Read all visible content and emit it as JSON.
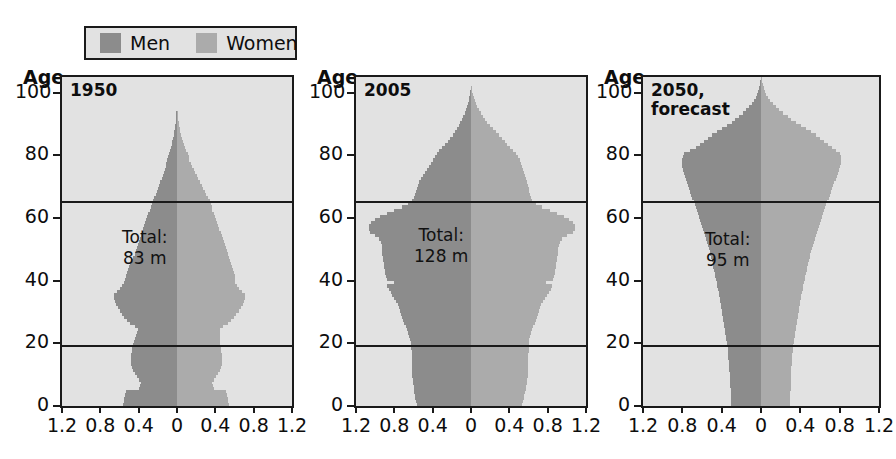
{
  "legend": {
    "men_label": "Men",
    "women_label": "Women",
    "men_color": "#8c8c8c",
    "women_color": "#ababab"
  },
  "axis": {
    "age_title": "Age",
    "y_ticks": [
      "100",
      "80",
      "60",
      "40",
      "20",
      "0"
    ],
    "x_ticks": [
      "1.2",
      "0.8",
      "0.4",
      "0",
      "0.4",
      "0.8",
      "1.2"
    ]
  },
  "panels": [
    {
      "title": "1950",
      "total": "Total:\n83 m"
    },
    {
      "title": "2005",
      "total": "Total:\n128 m"
    },
    {
      "title": "2050,\nforecast",
      "total": "Total:\n95 m"
    }
  ],
  "chart_data": {
    "type": "bar",
    "subtype": "population-pyramid",
    "title": "",
    "xlabel": "",
    "ylabel": "Age",
    "unit": "millions per single year of age",
    "xlim": [
      -1.2,
      1.2
    ],
    "ylim": [
      0,
      105
    ],
    "grid": false,
    "reference_lines": [
      19,
      65
    ],
    "legend_position": "top-left",
    "series_names": [
      "Men",
      "Women"
    ],
    "ages": [
      0,
      1,
      2,
      3,
      4,
      5,
      6,
      7,
      8,
      9,
      10,
      11,
      12,
      13,
      14,
      15,
      16,
      17,
      18,
      19,
      20,
      21,
      22,
      23,
      24,
      25,
      26,
      27,
      28,
      29,
      30,
      31,
      32,
      33,
      34,
      35,
      36,
      37,
      38,
      39,
      40,
      41,
      42,
      43,
      44,
      45,
      46,
      47,
      48,
      49,
      50,
      51,
      52,
      53,
      54,
      55,
      56,
      57,
      58,
      59,
      60,
      61,
      62,
      63,
      64,
      65,
      66,
      67,
      68,
      69,
      70,
      71,
      72,
      73,
      74,
      75,
      76,
      77,
      78,
      79,
      80,
      81,
      82,
      83,
      84,
      85,
      86,
      87,
      88,
      89,
      90,
      91,
      92,
      93,
      94,
      95,
      96,
      97,
      98,
      99,
      100,
      101,
      102,
      103,
      104
    ],
    "panels": [
      {
        "label": "1950",
        "total": 83,
        "total_text": "83 m",
        "men": [
          0.56,
          0.55,
          0.55,
          0.54,
          0.53,
          0.4,
          0.39,
          0.38,
          0.4,
          0.42,
          0.44,
          0.46,
          0.47,
          0.48,
          0.48,
          0.48,
          0.48,
          0.47,
          0.47,
          0.46,
          0.45,
          0.44,
          0.43,
          0.42,
          0.41,
          0.44,
          0.49,
          0.52,
          0.55,
          0.57,
          0.6,
          0.62,
          0.64,
          0.65,
          0.66,
          0.66,
          0.63,
          0.6,
          0.57,
          0.55,
          0.54,
          0.53,
          0.52,
          0.51,
          0.5,
          0.49,
          0.48,
          0.46,
          0.44,
          0.43,
          0.42,
          0.41,
          0.4,
          0.39,
          0.38,
          0.37,
          0.35,
          0.34,
          0.33,
          0.32,
          0.31,
          0.3,
          0.28,
          0.27,
          0.26,
          0.25,
          0.24,
          0.22,
          0.21,
          0.2,
          0.19,
          0.18,
          0.16,
          0.15,
          0.14,
          0.13,
          0.12,
          0.11,
          0.1,
          0.09,
          0.08,
          0.07,
          0.06,
          0.05,
          0.05,
          0.04,
          0.03,
          0.03,
          0.02,
          0.02,
          0.01,
          0.01,
          0.01,
          0.01,
          0.0,
          0.0,
          0.0,
          0.0,
          0.0,
          0.0,
          0.0,
          0.0,
          0.0,
          0.0,
          0.0
        ],
        "women": [
          0.54,
          0.53,
          0.53,
          0.52,
          0.51,
          0.39,
          0.38,
          0.37,
          0.39,
          0.41,
          0.43,
          0.45,
          0.46,
          0.47,
          0.47,
          0.47,
          0.47,
          0.46,
          0.46,
          0.45,
          0.45,
          0.45,
          0.45,
          0.45,
          0.45,
          0.48,
          0.53,
          0.56,
          0.59,
          0.62,
          0.65,
          0.67,
          0.69,
          0.7,
          0.71,
          0.71,
          0.68,
          0.65,
          0.63,
          0.61,
          0.6,
          0.6,
          0.59,
          0.58,
          0.57,
          0.56,
          0.55,
          0.54,
          0.53,
          0.52,
          0.51,
          0.5,
          0.49,
          0.48,
          0.47,
          0.46,
          0.44,
          0.43,
          0.42,
          0.41,
          0.4,
          0.39,
          0.37,
          0.36,
          0.35,
          0.34,
          0.32,
          0.3,
          0.29,
          0.27,
          0.26,
          0.24,
          0.22,
          0.21,
          0.19,
          0.18,
          0.16,
          0.15,
          0.13,
          0.12,
          0.11,
          0.09,
          0.08,
          0.07,
          0.06,
          0.05,
          0.04,
          0.03,
          0.03,
          0.02,
          0.02,
          0.01,
          0.01,
          0.01,
          0.0,
          0.0,
          0.0,
          0.0,
          0.0,
          0.0,
          0.0,
          0.0,
          0.0,
          0.0,
          0.0
        ]
      },
      {
        "label": "2005",
        "total": 128,
        "total_text": "128 m",
        "men": [
          0.56,
          0.57,
          0.58,
          0.58,
          0.59,
          0.6,
          0.6,
          0.61,
          0.61,
          0.62,
          0.62,
          0.62,
          0.62,
          0.62,
          0.62,
          0.62,
          0.62,
          0.62,
          0.63,
          0.63,
          0.63,
          0.64,
          0.65,
          0.66,
          0.67,
          0.68,
          0.7,
          0.71,
          0.72,
          0.73,
          0.74,
          0.75,
          0.76,
          0.78,
          0.8,
          0.82,
          0.84,
          0.86,
          0.88,
          0.8,
          0.88,
          0.89,
          0.9,
          0.9,
          0.91,
          0.91,
          0.92,
          0.92,
          0.93,
          0.93,
          0.93,
          0.93,
          0.94,
          0.96,
          1.0,
          1.05,
          1.06,
          1.06,
          1.04,
          1.0,
          0.95,
          0.88,
          0.8,
          0.72,
          0.66,
          0.62,
          0.6,
          0.58,
          0.57,
          0.56,
          0.55,
          0.54,
          0.52,
          0.5,
          0.48,
          0.46,
          0.44,
          0.42,
          0.4,
          0.38,
          0.36,
          0.33,
          0.3,
          0.27,
          0.24,
          0.22,
          0.19,
          0.17,
          0.15,
          0.13,
          0.11,
          0.09,
          0.08,
          0.06,
          0.05,
          0.04,
          0.03,
          0.02,
          0.02,
          0.01,
          0.01,
          0.0,
          0.0,
          0.0,
          0.0
        ],
        "women": [
          0.53,
          0.54,
          0.55,
          0.55,
          0.56,
          0.57,
          0.57,
          0.58,
          0.58,
          0.59,
          0.59,
          0.59,
          0.59,
          0.59,
          0.59,
          0.59,
          0.59,
          0.6,
          0.6,
          0.6,
          0.6,
          0.61,
          0.62,
          0.63,
          0.64,
          0.65,
          0.67,
          0.68,
          0.69,
          0.7,
          0.71,
          0.72,
          0.73,
          0.75,
          0.77,
          0.79,
          0.81,
          0.83,
          0.85,
          0.78,
          0.86,
          0.87,
          0.88,
          0.88,
          0.89,
          0.89,
          0.9,
          0.9,
          0.91,
          0.91,
          0.91,
          0.92,
          0.93,
          0.95,
          1.0,
          1.06,
          1.08,
          1.08,
          1.06,
          1.02,
          0.97,
          0.9,
          0.82,
          0.74,
          0.68,
          0.64,
          0.63,
          0.62,
          0.61,
          0.6,
          0.59,
          0.58,
          0.57,
          0.56,
          0.55,
          0.54,
          0.53,
          0.52,
          0.51,
          0.49,
          0.47,
          0.44,
          0.41,
          0.38,
          0.35,
          0.32,
          0.29,
          0.26,
          0.23,
          0.2,
          0.17,
          0.15,
          0.12,
          0.1,
          0.08,
          0.06,
          0.05,
          0.04,
          0.03,
          0.02,
          0.01,
          0.01,
          0.0,
          0.0,
          0.0
        ]
      },
      {
        "label": "2050, forecast",
        "total": 95,
        "total_text": "95 m",
        "men": [
          0.31,
          0.31,
          0.31,
          0.31,
          0.31,
          0.31,
          0.32,
          0.32,
          0.32,
          0.32,
          0.32,
          0.33,
          0.33,
          0.33,
          0.33,
          0.34,
          0.34,
          0.34,
          0.34,
          0.35,
          0.35,
          0.36,
          0.36,
          0.37,
          0.37,
          0.38,
          0.38,
          0.39,
          0.39,
          0.4,
          0.4,
          0.41,
          0.41,
          0.42,
          0.42,
          0.43,
          0.43,
          0.44,
          0.45,
          0.45,
          0.46,
          0.47,
          0.47,
          0.48,
          0.49,
          0.49,
          0.5,
          0.51,
          0.52,
          0.52,
          0.53,
          0.54,
          0.55,
          0.56,
          0.57,
          0.58,
          0.59,
          0.6,
          0.61,
          0.62,
          0.63,
          0.64,
          0.65,
          0.66,
          0.67,
          0.68,
          0.7,
          0.71,
          0.72,
          0.73,
          0.74,
          0.75,
          0.76,
          0.77,
          0.78,
          0.79,
          0.8,
          0.8,
          0.8,
          0.79,
          0.78,
          0.72,
          0.66,
          0.62,
          0.58,
          0.54,
          0.5,
          0.45,
          0.4,
          0.35,
          0.3,
          0.26,
          0.22,
          0.18,
          0.15,
          0.12,
          0.09,
          0.07,
          0.05,
          0.04,
          0.03,
          0.02,
          0.01,
          0.01,
          0.0
        ],
        "women": [
          0.29,
          0.29,
          0.29,
          0.29,
          0.29,
          0.3,
          0.3,
          0.3,
          0.3,
          0.31,
          0.31,
          0.31,
          0.31,
          0.32,
          0.32,
          0.32,
          0.32,
          0.33,
          0.33,
          0.33,
          0.34,
          0.34,
          0.35,
          0.35,
          0.36,
          0.36,
          0.37,
          0.37,
          0.38,
          0.38,
          0.39,
          0.39,
          0.4,
          0.4,
          0.41,
          0.41,
          0.42,
          0.43,
          0.43,
          0.44,
          0.45,
          0.45,
          0.46,
          0.47,
          0.47,
          0.48,
          0.49,
          0.5,
          0.5,
          0.51,
          0.52,
          0.53,
          0.54,
          0.55,
          0.56,
          0.57,
          0.58,
          0.59,
          0.6,
          0.61,
          0.62,
          0.63,
          0.64,
          0.65,
          0.66,
          0.67,
          0.69,
          0.7,
          0.71,
          0.72,
          0.73,
          0.74,
          0.76,
          0.77,
          0.78,
          0.79,
          0.8,
          0.81,
          0.81,
          0.81,
          0.8,
          0.76,
          0.72,
          0.68,
          0.64,
          0.6,
          0.56,
          0.51,
          0.46,
          0.41,
          0.36,
          0.31,
          0.27,
          0.22,
          0.18,
          0.15,
          0.12,
          0.09,
          0.07,
          0.05,
          0.04,
          0.03,
          0.02,
          0.01,
          0.01
        ]
      }
    ]
  }
}
